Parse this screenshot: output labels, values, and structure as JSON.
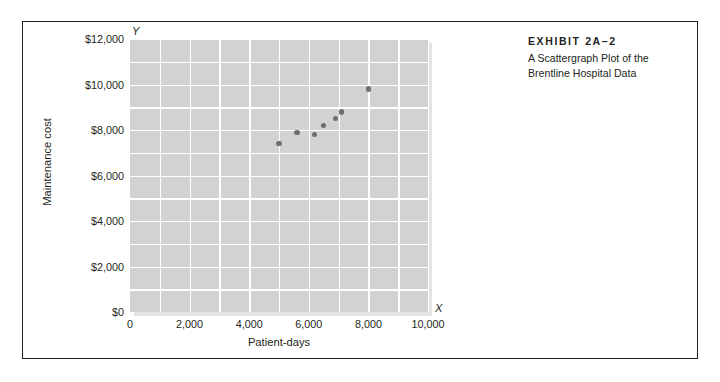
{
  "exhibit": {
    "label": "EXHIBIT 2A–2",
    "subtitle_line1": "A Scattergraph Plot of the",
    "subtitle_line2": "Brentline Hospital Data"
  },
  "colors": {
    "frame_border": "#231f20",
    "plot_background": "#d2d2d2",
    "gridline": "#ffffff",
    "point_fill": "#6d6e71",
    "text": "#231f20"
  },
  "chart_data": {
    "type": "scatter",
    "title": "A Scattergraph Plot of the Brentline Hospital Data",
    "xlabel": "Patient-days",
    "ylabel": "Maintenance cost",
    "x_axis_letter": "X",
    "y_axis_letter": "Y",
    "xlim": [
      0,
      10000
    ],
    "ylim": [
      0,
      12000
    ],
    "grid": true,
    "grid_major_x": 2000,
    "grid_minor_x": 1000,
    "grid_major_y": 2000,
    "grid_minor_y": 1000,
    "legend": null,
    "xticks": [
      0,
      2000,
      4000,
      6000,
      8000,
      10000
    ],
    "xticklabels": [
      "0",
      "2,000",
      "4,000",
      "6,000",
      "8,000",
      "10,000"
    ],
    "yticks": [
      0,
      2000,
      4000,
      6000,
      8000,
      10000,
      12000
    ],
    "yticklabels": [
      "$0",
      "$2,000",
      "$4,000",
      "$6,000",
      "$8,000",
      "$10,000",
      "$12,000"
    ],
    "x": [
      5000,
      5600,
      6200,
      6500,
      6900,
      7100,
      8000
    ],
    "y": [
      7400,
      7900,
      7800,
      8200,
      8500,
      8800,
      9800
    ],
    "points": [
      {
        "x": 5000,
        "y": 7400
      },
      {
        "x": 5600,
        "y": 7900
      },
      {
        "x": 6200,
        "y": 7800
      },
      {
        "x": 6500,
        "y": 8200
      },
      {
        "x": 6900,
        "y": 8500
      },
      {
        "x": 7100,
        "y": 8800
      },
      {
        "x": 8000,
        "y": 9800
      }
    ]
  }
}
